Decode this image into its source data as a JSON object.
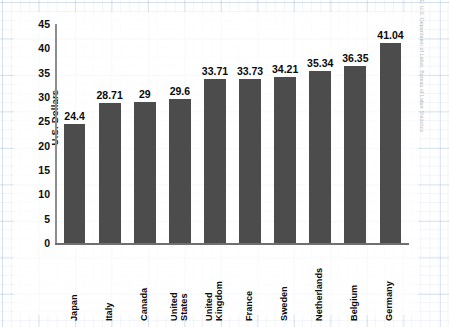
{
  "chart_data": {
    "type": "bar",
    "title": "",
    "subtitle": "",
    "xlabel": "",
    "ylabel": "U.S. Dollars",
    "ylim": [
      0,
      45
    ],
    "ytick_step": 5,
    "yticks": [
      "45",
      "40",
      "35",
      "30",
      "25",
      "20",
      "15",
      "10",
      "5",
      "0"
    ],
    "grid": true,
    "grid_style": "graph-paper",
    "legend": "none",
    "orientation": "vertical",
    "categories": [
      "Japan",
      "Italy",
      "Canada",
      "United States",
      "United Kingdom",
      "France",
      "Sweden",
      "Netherlands",
      "Belgium",
      "Germany"
    ],
    "category_lines": [
      [
        "Japan"
      ],
      [
        "Italy"
      ],
      [
        "Canada"
      ],
      [
        "United",
        "States"
      ],
      [
        "United",
        "Kingdom"
      ],
      [
        "France"
      ],
      [
        "Sweden"
      ],
      [
        "Netherlands"
      ],
      [
        "Belgium"
      ],
      [
        "Germany"
      ]
    ],
    "values": [
      24.4,
      28.71,
      29,
      29.6,
      33.71,
      33.73,
      34.21,
      35.34,
      36.35,
      41.04
    ],
    "value_labels": [
      "24.4",
      "28.71",
      "29",
      "29.6",
      "33.71",
      "33.73",
      "34.21",
      "35.34",
      "36.35",
      "41.04"
    ],
    "colors": {
      "bar": "#4c4c4c",
      "axis": "#6f6f6f",
      "text": "#0a0a0a",
      "grid": "#96afcd",
      "background": "#ffffff"
    }
  },
  "footer": {
    "source": "SOURCE: U.S. Department of Labor, Bureau of Labor Statistics"
  }
}
